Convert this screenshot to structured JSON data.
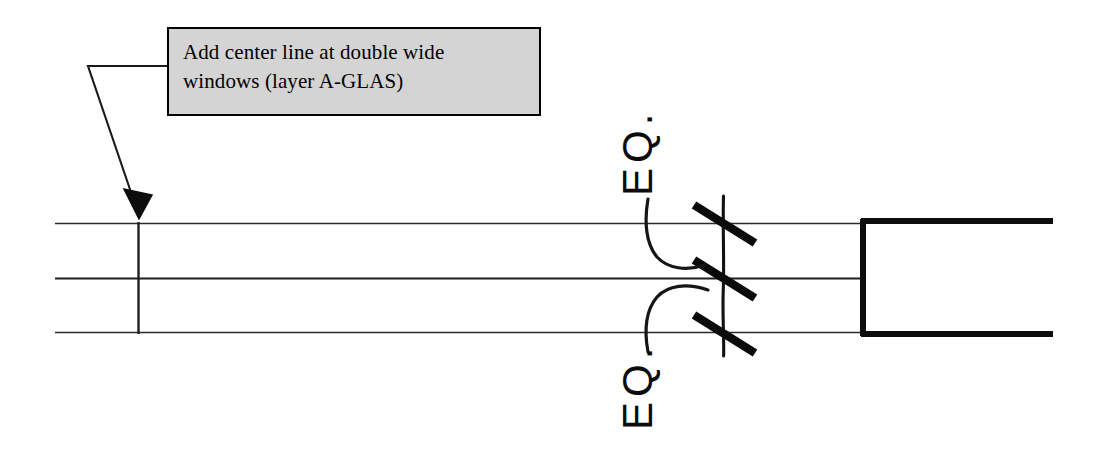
{
  "document": {
    "type": "architectural-drawing-markup",
    "title": "Window head / wall plan detail with redline note"
  },
  "callout": {
    "note_line_1": "Add center line at double wide",
    "note_line_2": "windows (layer A-GLAS)",
    "note_full": "Add center line at double wide windows (layer A-GLAS)",
    "fill_color": "#d4d4d4",
    "border_color": "#000000"
  },
  "annotations": {
    "eq_top": "EQ.",
    "eq_bottom": "EQ.",
    "hand_markup_color": "#0b0b0b"
  },
  "drawing": {
    "line_color": "#1a1a1a",
    "thick_line_color": "#000000",
    "leader_color": "#1a1a1a"
  }
}
